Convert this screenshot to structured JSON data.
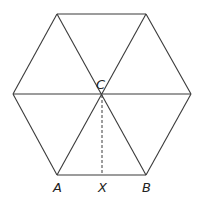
{
  "diagram": {
    "labels": {
      "A": "A",
      "B": "B",
      "C": "C",
      "X": "X"
    },
    "points": {
      "top_left": [
        57,
        14
      ],
      "top_right": [
        146,
        14
      ],
      "left": [
        13,
        94
      ],
      "right": [
        191,
        94
      ],
      "A": [
        57,
        175
      ],
      "B": [
        146,
        175
      ],
      "C": [
        102,
        94
      ],
      "X": [
        102,
        175
      ]
    },
    "segments": [
      {
        "from": "top_left",
        "to": "top_right",
        "style": "solid"
      },
      {
        "from": "top_right",
        "to": "right",
        "style": "solid"
      },
      {
        "from": "right",
        "to": "B",
        "style": "solid"
      },
      {
        "from": "B",
        "to": "A",
        "style": "solid"
      },
      {
        "from": "A",
        "to": "left",
        "style": "solid"
      },
      {
        "from": "left",
        "to": "top_left",
        "style": "solid"
      },
      {
        "from": "left",
        "to": "right",
        "style": "solid"
      },
      {
        "from": "top_left",
        "to": "B",
        "style": "solid"
      },
      {
        "from": "top_right",
        "to": "A",
        "style": "solid"
      },
      {
        "from": "C",
        "to": "X",
        "style": "dashed"
      }
    ],
    "colors": {
      "line": "#3a3a3a",
      "text": "#222222",
      "background": "#ffffff"
    }
  }
}
